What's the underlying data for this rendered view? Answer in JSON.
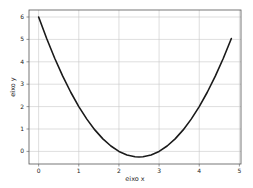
{
  "chart_data": {
    "type": "line",
    "title": "",
    "xlabel": "eixo x",
    "ylabel": "eixo y",
    "xlim": [
      -0.24,
      5.04
    ],
    "ylim": [
      -0.5625,
      6.3125
    ],
    "xticks": [
      0,
      1,
      2,
      3,
      4,
      5
    ],
    "yticks": [
      0,
      1,
      2,
      3,
      4,
      5,
      6
    ],
    "xtick_labels": [
      "0",
      "1",
      "2",
      "3",
      "4",
      "5"
    ],
    "ytick_labels": [
      "0",
      "1",
      "2",
      "3",
      "4",
      "5",
      "6"
    ],
    "grid": true,
    "legend": "none",
    "series": [
      {
        "name": "y = x^2 - 5x + 6",
        "color": "#1a1a1a",
        "x": [
          0,
          0.2,
          0.4,
          0.6,
          0.8,
          1.0,
          1.2,
          1.4,
          1.6,
          1.8,
          2.0,
          2.2,
          2.4,
          2.5,
          2.6,
          2.8,
          3.0,
          3.2,
          3.4,
          3.6,
          3.8,
          4.0,
          4.2,
          4.4,
          4.6,
          4.8
        ],
        "y": [
          6.0,
          5.04,
          4.16,
          3.36,
          2.64,
          2.0,
          1.44,
          0.96,
          0.56,
          0.24,
          0.0,
          -0.16,
          -0.24,
          -0.25,
          -0.24,
          -0.16,
          0.0,
          0.24,
          0.56,
          0.96,
          1.44,
          2.0,
          2.64,
          3.36,
          4.16,
          5.04
        ]
      }
    ]
  }
}
